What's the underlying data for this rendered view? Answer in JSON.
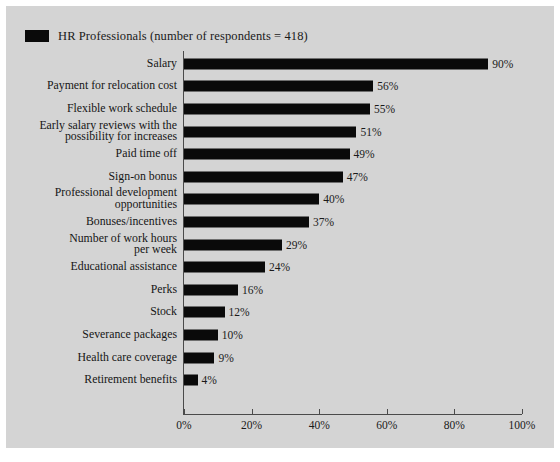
{
  "legend": {
    "label": "HR Professionals (number of respondents = 418)",
    "swatch_color": "#0a0a0a",
    "icon": "legend-square-icon"
  },
  "colors": {
    "background": "#d4d4d4",
    "bar": "#0a0a0a",
    "axis": "#4a4a4a",
    "text": "#1a1a1a"
  },
  "chart_data": {
    "type": "bar",
    "orientation": "horizontal",
    "title": "",
    "subtitle": "",
    "xlabel": "",
    "ylabel": "",
    "xlim": [
      0,
      100
    ],
    "grid": false,
    "legend_position": "top-left",
    "tick_labels": [
      "0%",
      "20%",
      "40%",
      "60%",
      "80%",
      "100%"
    ],
    "ticks": [
      0,
      20,
      40,
      60,
      80,
      100
    ],
    "categories": [
      "Salary",
      "Payment for relocation cost",
      "Flexible work schedule",
      "Early salary reviews with the\npossibility for increases",
      "Paid time off",
      "Sign-on bonus",
      "Professional development\nopportunities",
      "Bonuses/incentives",
      "Number of work hours\nper week",
      "Educational assistance",
      "Perks",
      "Stock",
      "Severance packages",
      "Health care coverage",
      "Retirement benefits"
    ],
    "values": [
      90,
      56,
      55,
      51,
      49,
      47,
      40,
      37,
      29,
      24,
      16,
      12,
      10,
      9,
      4
    ],
    "value_labels": [
      "90%",
      "56%",
      "55%",
      "51%",
      "49%",
      "47%",
      "40%",
      "37%",
      "29%",
      "24%",
      "16%",
      "12%",
      "10%",
      "9%",
      "4%"
    ],
    "series": [
      {
        "name": "HR Professionals (number of respondents = 418)",
        "values": [
          90,
          56,
          55,
          51,
          49,
          47,
          40,
          37,
          29,
          24,
          16,
          12,
          10,
          9,
          4
        ]
      }
    ]
  }
}
